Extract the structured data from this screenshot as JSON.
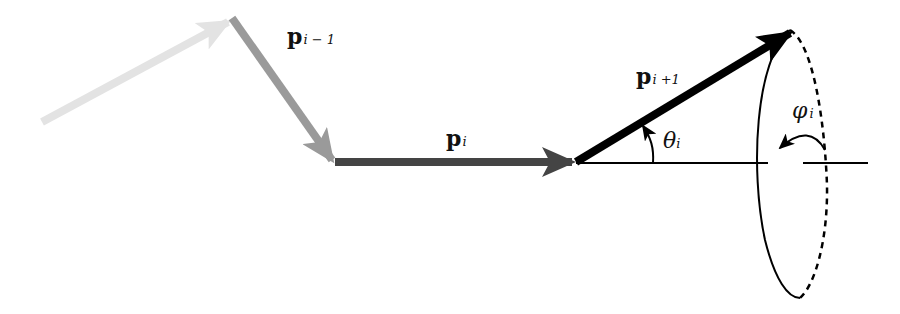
{
  "diagram": {
    "colors": {
      "p_im2": "#e3e3e3",
      "p_im1": "#9a9a9a",
      "p_i": "#444444",
      "p_ip1": "#000000",
      "axis": "#000000"
    },
    "labels": {
      "p_im1": {
        "main": "p",
        "sub": "i − 1"
      },
      "p_i": {
        "main": "p",
        "sub": "i"
      },
      "p_ip1": {
        "main": "p",
        "sub": "i +1"
      },
      "theta": {
        "main": "θ",
        "sub": "i"
      },
      "phi": {
        "main": "φ",
        "sub": "i"
      }
    }
  }
}
